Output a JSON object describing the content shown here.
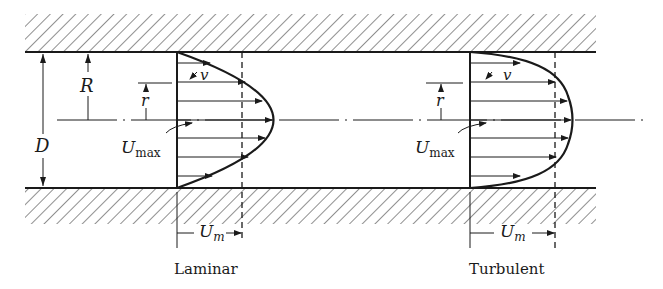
{
  "labels": {
    "D": "D",
    "R": "R",
    "r_left": "r",
    "r_right": "r",
    "v_left": "v",
    "v_right": "v",
    "umax_left_main": "U",
    "umax_left_sub": "max",
    "umax_right_main": "U",
    "umax_right_sub": "max",
    "um_left_main": "U",
    "um_left_sub": "m",
    "um_right_main": "U",
    "um_right_sub": "m"
  },
  "captions": {
    "laminar": "Laminar",
    "turbulent": "Turbulent"
  },
  "colors": {
    "ink": "#1a1a1a",
    "background": "#ffffff"
  }
}
